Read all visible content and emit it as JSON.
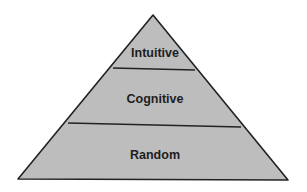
{
  "diagram": {
    "type": "pyramid",
    "colors": {
      "fill": "#bdbdbd",
      "stroke": "#222222",
      "background": "#ffffff"
    },
    "levels": [
      {
        "label": "Intuitive",
        "position": "top"
      },
      {
        "label": "Cognitive",
        "position": "middle"
      },
      {
        "label": "Random",
        "position": "bottom"
      }
    ]
  }
}
